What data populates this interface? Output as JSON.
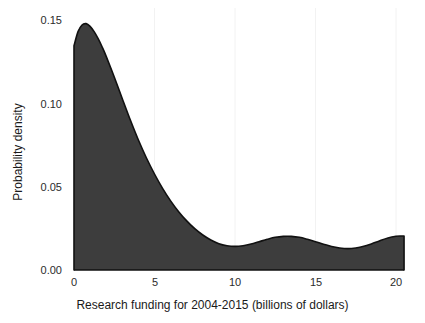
{
  "chart_data": {
    "type": "area",
    "title": "",
    "subtitle": "",
    "xlabel": "Research funding for 2004-2015 (billions of dollars)",
    "ylabel": "Probability density",
    "xlim": [
      -0.9,
      21.6
    ],
    "ylim": [
      0.0,
      0.158
    ],
    "xticks": [
      0,
      5,
      10,
      15,
      20
    ],
    "xtick_labels": [
      "0",
      "5",
      "10",
      "15",
      "20"
    ],
    "yticks": [
      0.0,
      0.05,
      0.1,
      0.15
    ],
    "ytick_labels": [
      "0.00",
      "0.05",
      "0.10",
      "0.15"
    ],
    "grid": "faint vertical gridlines at x ticks only",
    "legend": "none",
    "fill_color": "#3d3d3d",
    "line_color": "#111111",
    "background_color": "#ffffff",
    "series": [
      {
        "name": "Kernel density of research funding",
        "x": [
          0.0,
          0.25,
          0.5,
          0.75,
          1.0,
          1.25,
          1.5,
          1.75,
          2.0,
          2.5,
          3.0,
          3.5,
          4.0,
          4.5,
          5.0,
          5.5,
          6.0,
          6.5,
          7.0,
          7.5,
          8.0,
          8.5,
          9.0,
          9.5,
          10.0,
          10.5,
          11.0,
          11.5,
          12.0,
          12.5,
          13.0,
          13.5,
          14.0,
          14.5,
          15.0,
          15.5,
          16.0,
          16.5,
          17.0,
          17.5,
          18.0,
          18.5,
          19.0,
          19.5,
          20.0,
          20.3,
          20.5
        ],
        "y": [
          0.1345,
          0.143,
          0.147,
          0.1478,
          0.1462,
          0.143,
          0.1388,
          0.1338,
          0.1282,
          0.1158,
          0.1028,
          0.09,
          0.078,
          0.0672,
          0.0576,
          0.049,
          0.0415,
          0.035,
          0.0295,
          0.0248,
          0.021,
          0.018,
          0.0158,
          0.0146,
          0.0142,
          0.0146,
          0.0156,
          0.017,
          0.0184,
          0.0196,
          0.0202,
          0.0202,
          0.0196,
          0.0184,
          0.017,
          0.0155,
          0.0141,
          0.0132,
          0.0128,
          0.0132,
          0.0142,
          0.0158,
          0.0176,
          0.0192,
          0.0202,
          0.0204,
          0.0204
        ]
      }
    ],
    "peak": {
      "x": 0.75,
      "y": 0.148
    },
    "local_minimum": {
      "x": 10.0,
      "y": 0.0142
    },
    "local_maximum_secondary": {
      "x": 13.0,
      "y": 0.0202
    },
    "local_minimum_secondary": {
      "x": 17.0,
      "y": 0.0128
    }
  },
  "axes": {
    "x_title": "Research funding for 2004-2015 (billions of dollars)",
    "y_title": "Probability density",
    "x_tick_labels": [
      "0",
      "5",
      "10",
      "15",
      "20"
    ],
    "y_tick_labels": [
      "0.00",
      "0.05",
      "0.10",
      "0.15"
    ]
  }
}
